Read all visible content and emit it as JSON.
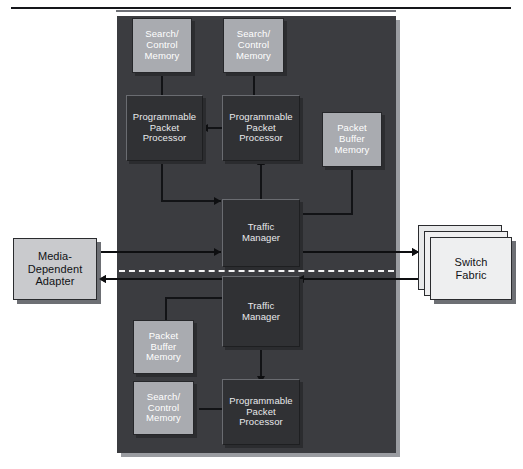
{
  "figure": {
    "caption_fragment": "",
    "panel_label": "network-processor-chip"
  },
  "blocks": {
    "search_control_memory_1": {
      "line1": "Search/",
      "line2": "Control",
      "line3": "Memory"
    },
    "search_control_memory_2": {
      "line1": "Search/",
      "line2": "Control",
      "line3": "Memory"
    },
    "search_control_memory_3": {
      "line1": "Search/",
      "line2": "Control",
      "line3": "Memory"
    },
    "programmable_packet_processor_1": {
      "line1": "Programmable",
      "line2": "Packet",
      "line3": "Processor"
    },
    "programmable_packet_processor_2": {
      "line1": "Programmable",
      "line2": "Packet",
      "line3": "Processor"
    },
    "programmable_packet_processor_3": {
      "line1": "Programmable",
      "line2": "Packet",
      "line3": "Processor"
    },
    "packet_buffer_memory_1": {
      "line1": "Packet",
      "line2": "Buffer",
      "line3": "Memory"
    },
    "packet_buffer_memory_2": {
      "line1": "Packet",
      "line2": "Buffer",
      "line3": "Memory"
    },
    "traffic_manager_1": {
      "line1": "Traffic",
      "line2": "Manager"
    },
    "traffic_manager_2": {
      "line1": "Traffic",
      "line2": "Manager"
    },
    "media_dependent_adapter": {
      "line1": "Media-",
      "line2": "Dependent",
      "line3": "Adapter"
    },
    "switch_fabric": {
      "line1": "Switch",
      "line2": "Fabric"
    }
  },
  "colors": {
    "panel_fill": "#3b3c40",
    "dark_block_fill": "#303134",
    "memory_block_fill": "#a9abb0",
    "external_block_fill": "#c9cacd",
    "switch_fabric_fill": "#eeeff0",
    "line": "#0e0f11",
    "dashed_separator": "#f2f2f3",
    "page_background": "#ffffff"
  }
}
